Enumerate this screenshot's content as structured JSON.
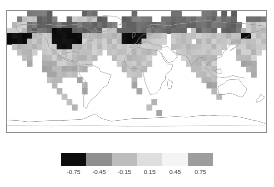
{
  "figure": {
    "title": "",
    "background": "#ffffff"
  },
  "map": {
    "name": "global-anomaly-map",
    "projection": "equirectangular",
    "lon_range": [
      -180,
      180
    ],
    "lat_range": [
      -90,
      90
    ],
    "frame_color": "#8d8d8d",
    "nodata_color": "#ffffff",
    "coastline_color": "#9a9a9a"
  },
  "colorbar": {
    "orientation": "horizontal",
    "tick_labels": [
      "-0.75",
      "-0.45",
      "-0.15",
      "0.15",
      "0.45",
      "0.75"
    ],
    "tick_values": [
      -0.75,
      -0.45,
      -0.15,
      0.15,
      0.45,
      0.75
    ],
    "boundaries": [
      -0.9,
      -0.6,
      -0.3,
      0.0,
      0.3,
      0.6,
      0.9
    ],
    "swatch_colors": [
      "#0d0d0d",
      "#8f8f8f",
      "#bdbdbd",
      "#dedede",
      "#f4f4f4",
      "#9d9d9d"
    ],
    "extend": "neither"
  },
  "chart_data": {
    "type": "heatmap",
    "title": "",
    "xlabel": "",
    "ylabel": "",
    "x": "longitude",
    "y": "latitude",
    "xlim": [
      -180,
      180
    ],
    "ylim": [
      -90,
      90
    ],
    "grid": false,
    "legend_position": "bottom",
    "cmap": "grayscale-diverging",
    "vmin": -0.9,
    "vmax": 0.9,
    "cell_size_deg": [
      6.9,
      8.2
    ],
    "colorbar_tick_labels": [
      "-0.75",
      "-0.45",
      "-0.15",
      "0.15",
      "0.45",
      "0.75"
    ],
    "colorbar_tick_values": [
      -0.75,
      -0.45,
      -0.15,
      0.15,
      0.45,
      0.75
    ],
    "nodata_value": null,
    "ncols": 52,
    "nrows": 22,
    "value_levels": [
      -0.75,
      -0.45,
      -0.15,
      0.15,
      0.45,
      0.75
    ],
    "level_colors": [
      "#0d0d0d",
      "#8f8f8f",
      "#bdbdbd",
      "#dedede",
      "#f4f4f4",
      "#9d9d9d"
    ],
    "grid_rows": [
      "....nnnnn......nnn.......n.......nn....nnn.n.n......",
      "..nmmmnnnn..nmmmmmnn...nnnnnn..nnnnnnnnnnnnnnn..nnnn",
      ".mmmnnnnnnnnnnnnnnnnnn.nnnnnnnnnnnnnnnnnnnnnnnn.mmmm",
      "mmmmnnnnnNNNNnnnnnnmmmnnnnnnnnnnnnnn.mnnnn.nnnnmmmmm",
      "NNNNNmmmmNNNNNNmmmmmmmmNNNNNmmmm.mmmmmmmmmmmmmmNNmmm",
      "NNNNmmmmmNNNNNNmmmmmmmmNNNNmmmmm.mmmm.mmmmmmmmmmmmmm",
      ".mmmmmmmmmNNNmmmmmmmmmmmmmmmmmm..mmmmmmmmmmm..mmmmmm",
      "..mmmm.mmmmmmmmmmmm.mmmmmmmmmm....mmmmmmmmm...mmmmm.",
      "...mm..mmmmmmmmmmm...mmmmmmmm......mmmmmmm....mmmm..",
      "....l..lllmmmmmmm.....mmmmmmm.......mmmmmm.....lll..",
      ".......lllllllll.......mmmmm.........mmmmm......ll..",
      "........llllll..........mmm...........mmmm.......l..",
      "........lll...l..........l.............mmm..........",
      ".........l.....l.........l..............ll..........",
      "..........l....l..........l..............l..........",
      "...........l..............................l.........",
      "............l................l......................",
      ".............l..............l.......................",
      "..............................l.....................",
      "....................................................",
      "....................................................",
      "...................................................."
    ],
    "grid_legend": {
      "N": "strong negative (<= -0.6)",
      "n": "negative (-0.6 to -0.3)",
      "m": "weak negative to neutral (-0.3 to 0.15)",
      "l": "weak positive (0.15 to 0.45)",
      ".": "no data / blank"
    }
  }
}
